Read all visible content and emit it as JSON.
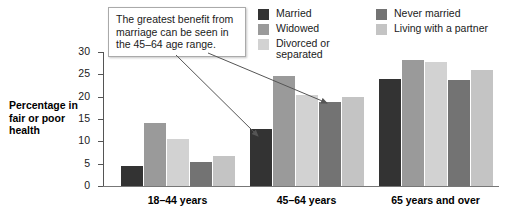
{
  "chart_data": {
    "type": "bar",
    "title": "",
    "xlabel": "",
    "ylabel": "Percentage in fair or poor health",
    "ylim": [
      0,
      30
    ],
    "yticks": [
      0,
      5,
      10,
      15,
      20,
      25,
      30
    ],
    "grid": false,
    "legend_position": "top-right",
    "categories": [
      "18–44 years",
      "45–64 years",
      "65 years and over"
    ],
    "series": [
      {
        "name": "Married",
        "color": "#333333",
        "values": [
          4.5,
          12.8,
          24.0
        ]
      },
      {
        "name": "Widowed",
        "color": "#9a9a9a",
        "values": [
          14.1,
          24.7,
          28.2
        ]
      },
      {
        "name": "Divorced or separated",
        "color": "#d2d2d2",
        "values": [
          10.6,
          20.4,
          27.8
        ]
      },
      {
        "name": "Never married",
        "color": "#737373",
        "values": [
          5.3,
          18.7,
          23.8
        ]
      },
      {
        "name": "Living with a partner",
        "color": "#c4c4c4",
        "values": [
          6.7,
          20.0,
          26.0
        ]
      }
    ],
    "annotations": [
      {
        "text": "The greatest benefit from marriage can be seen in the 45–64 age range.",
        "points_to": [
          "45–64 years / Married",
          "45–64 years / Never married"
        ]
      }
    ]
  },
  "axis": {
    "y_title": "Percentage\nin fair or\npoor health",
    "y_tick_labels": [
      "30",
      "25",
      "20",
      "15",
      "10",
      "5",
      "0"
    ]
  },
  "legend": {
    "left_column": [
      {
        "label": "Married",
        "swatch": "#333333"
      },
      {
        "label": "Widowed",
        "swatch": "#9a9a9a"
      },
      {
        "label": "Divorced or\nseparated",
        "swatch": "#d2d2d2"
      }
    ],
    "right_column": [
      {
        "label": "Never married",
        "swatch": "#737373"
      },
      {
        "label": "Living with a partner",
        "swatch": "#c4c4c4"
      }
    ]
  },
  "callout": {
    "text": "The greatest benefit from marriage can be seen in the 45–64 age range."
  }
}
